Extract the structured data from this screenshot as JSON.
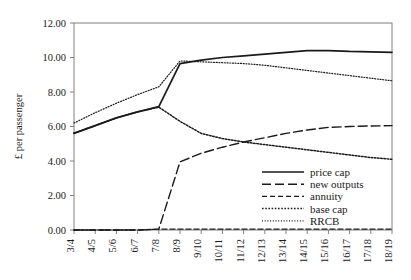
{
  "chart_data": {
    "type": "line",
    "title": "",
    "xlabel": "",
    "ylabel": "£ per passenger",
    "ylim": [
      0,
      12
    ],
    "ytick_labels": [
      "0.00",
      "2.00",
      "4.00",
      "6.00",
      "8.00",
      "10.00",
      "12.00"
    ],
    "yticks": [
      0,
      2,
      4,
      6,
      8,
      10,
      12
    ],
    "grid": false,
    "legend_position": "lower-right-inside",
    "categories": [
      "3/4",
      "4/5",
      "5/6",
      "6/7",
      "7/8",
      "8/9",
      "9/10",
      "10/11",
      "11/12",
      "12/13",
      "13/14",
      "14/15",
      "15/16",
      "16/17",
      "17/18",
      "18/19"
    ],
    "series": [
      {
        "name": "price cap",
        "style": "solid",
        "values": [
          5.6,
          6.05,
          6.5,
          6.85,
          7.15,
          9.65,
          9.85,
          10.0,
          10.1,
          10.2,
          10.3,
          10.4,
          10.4,
          10.35,
          10.33,
          10.3
        ]
      },
      {
        "name": "new outputs",
        "style": "long-dash",
        "values": [
          0.0,
          0.0,
          0.0,
          0.0,
          0.05,
          3.95,
          4.45,
          4.8,
          5.1,
          5.35,
          5.6,
          5.8,
          5.95,
          6.0,
          6.03,
          6.05
        ]
      },
      {
        "name": "annuity",
        "style": "dash",
        "values": [
          0.0,
          0.0,
          0.0,
          0.0,
          0.05,
          0.05,
          0.05,
          0.05,
          0.05,
          0.05,
          0.05,
          0.05,
          0.05,
          0.05,
          0.05,
          0.05
        ]
      },
      {
        "name": "base cap",
        "style": "dotted",
        "values": [
          5.62,
          6.05,
          6.5,
          6.85,
          7.12,
          6.3,
          5.6,
          5.3,
          5.1,
          4.95,
          4.8,
          4.65,
          4.5,
          4.35,
          4.2,
          4.1
        ]
      },
      {
        "name": "RRCB",
        "style": "fine-dotted",
        "values": [
          6.2,
          6.8,
          7.35,
          7.85,
          8.3,
          9.8,
          9.75,
          9.7,
          9.65,
          9.55,
          9.4,
          9.25,
          9.1,
          8.95,
          8.8,
          8.65
        ]
      }
    ],
    "legend": [
      {
        "label": "price cap",
        "style": "solid"
      },
      {
        "label": "new outputs",
        "style": "long-dash"
      },
      {
        "label": "annuity",
        "style": "dash"
      },
      {
        "label": "base cap",
        "style": "dotted"
      },
      {
        "label": "RRCB",
        "style": "fine-dotted"
      }
    ],
    "colors": {
      "line": "#1a1a1a",
      "axis": "#808080",
      "background": "#ffffff"
    }
  }
}
